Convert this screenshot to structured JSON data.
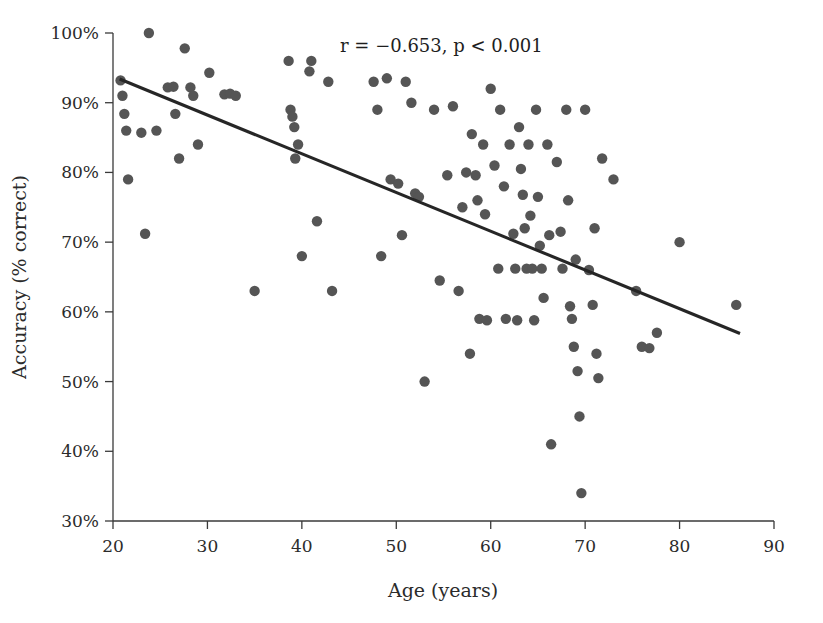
{
  "chart_data": {
    "type": "scatter",
    "title": "",
    "xlabel": "Age (years)",
    "ylabel": "Accuracy (% correct)",
    "xlim": [
      20,
      90
    ],
    "ylim": [
      30,
      100
    ],
    "xticks": [
      20,
      30,
      40,
      50,
      60,
      70,
      80,
      90
    ],
    "xtick_labels": [
      "20",
      "30",
      "40",
      "50",
      "60",
      "70",
      "80",
      "90"
    ],
    "yticks": [
      30,
      40,
      50,
      60,
      70,
      80,
      90,
      100
    ],
    "ytick_labels": [
      "30%",
      "40%",
      "50%",
      "60%",
      "70%",
      "80%",
      "90%",
      "100%"
    ],
    "grid": false,
    "legend": "none",
    "point_color": "#555555",
    "point_radius": 5.2,
    "annotation": "r = −−.653, p < 0.001",
    "annotation_text": "r = −0.653, p < 0.001",
    "annotation_x": 46.5,
    "annotation_y": 97.0,
    "correlation_r": -0.653,
    "p_value_text": "p < 0.001",
    "trend_line": {
      "color": "#262626",
      "x_start": 20.7,
      "y_start": 93.4,
      "x_end": 86.4,
      "y_end": 56.9
    },
    "points": [
      {
        "x": 20.8,
        "y": 93.2
      },
      {
        "x": 21.0,
        "y": 91.0
      },
      {
        "x": 21.2,
        "y": 88.4
      },
      {
        "x": 21.4,
        "y": 86.0
      },
      {
        "x": 21.6,
        "y": 79.0
      },
      {
        "x": 23.0,
        "y": 85.7
      },
      {
        "x": 23.4,
        "y": 71.2
      },
      {
        "x": 23.8,
        "y": 100.0
      },
      {
        "x": 24.6,
        "y": 86.0
      },
      {
        "x": 25.8,
        "y": 92.2
      },
      {
        "x": 26.4,
        "y": 92.3
      },
      {
        "x": 26.6,
        "y": 88.4
      },
      {
        "x": 27.0,
        "y": 82.0
      },
      {
        "x": 27.6,
        "y": 97.8
      },
      {
        "x": 28.2,
        "y": 92.2
      },
      {
        "x": 28.5,
        "y": 91.0
      },
      {
        "x": 29.0,
        "y": 84.0
      },
      {
        "x": 30.2,
        "y": 94.3
      },
      {
        "x": 31.8,
        "y": 91.2
      },
      {
        "x": 32.4,
        "y": 91.3
      },
      {
        "x": 33.0,
        "y": 91.0
      },
      {
        "x": 35.0,
        "y": 63.0
      },
      {
        "x": 38.6,
        "y": 96.0
      },
      {
        "x": 38.8,
        "y": 89.0
      },
      {
        "x": 39.0,
        "y": 88.0
      },
      {
        "x": 39.2,
        "y": 86.5
      },
      {
        "x": 39.3,
        "y": 82.0
      },
      {
        "x": 39.6,
        "y": 84.0
      },
      {
        "x": 40.0,
        "y": 68.0
      },
      {
        "x": 40.8,
        "y": 94.5
      },
      {
        "x": 41.0,
        "y": 96.0
      },
      {
        "x": 41.6,
        "y": 73.0
      },
      {
        "x": 42.8,
        "y": 93.0
      },
      {
        "x": 43.2,
        "y": 63.0
      },
      {
        "x": 47.6,
        "y": 93.0
      },
      {
        "x": 48.0,
        "y": 89.0
      },
      {
        "x": 48.4,
        "y": 68.0
      },
      {
        "x": 49.0,
        "y": 93.5
      },
      {
        "x": 49.4,
        "y": 79.0
      },
      {
        "x": 50.2,
        "y": 78.4
      },
      {
        "x": 50.6,
        "y": 71.0
      },
      {
        "x": 51.0,
        "y": 93.0
      },
      {
        "x": 51.6,
        "y": 90.0
      },
      {
        "x": 52.0,
        "y": 77.0
      },
      {
        "x": 52.4,
        "y": 76.5
      },
      {
        "x": 53.0,
        "y": 50.0
      },
      {
        "x": 54.0,
        "y": 89.0
      },
      {
        "x": 54.6,
        "y": 64.5
      },
      {
        "x": 55.4,
        "y": 79.6
      },
      {
        "x": 56.0,
        "y": 89.5
      },
      {
        "x": 56.6,
        "y": 63.0
      },
      {
        "x": 57.0,
        "y": 75.0
      },
      {
        "x": 57.4,
        "y": 80.0
      },
      {
        "x": 57.8,
        "y": 54.0
      },
      {
        "x": 58.0,
        "y": 85.5
      },
      {
        "x": 58.4,
        "y": 79.6
      },
      {
        "x": 58.6,
        "y": 76.0
      },
      {
        "x": 58.8,
        "y": 59.0
      },
      {
        "x": 59.2,
        "y": 84.0
      },
      {
        "x": 59.4,
        "y": 74.0
      },
      {
        "x": 59.6,
        "y": 58.8
      },
      {
        "x": 60.0,
        "y": 92.0
      },
      {
        "x": 60.4,
        "y": 81.0
      },
      {
        "x": 60.8,
        "y": 66.2
      },
      {
        "x": 61.0,
        "y": 89.0
      },
      {
        "x": 61.4,
        "y": 78.0
      },
      {
        "x": 61.6,
        "y": 59.0
      },
      {
        "x": 62.0,
        "y": 84.0
      },
      {
        "x": 62.4,
        "y": 71.2
      },
      {
        "x": 62.6,
        "y": 66.2
      },
      {
        "x": 62.8,
        "y": 58.8
      },
      {
        "x": 63.0,
        "y": 86.5
      },
      {
        "x": 63.2,
        "y": 80.5
      },
      {
        "x": 63.4,
        "y": 76.8
      },
      {
        "x": 63.6,
        "y": 72.0
      },
      {
        "x": 63.8,
        "y": 66.2
      },
      {
        "x": 64.0,
        "y": 84.0
      },
      {
        "x": 64.2,
        "y": 73.8
      },
      {
        "x": 64.4,
        "y": 66.2
      },
      {
        "x": 64.6,
        "y": 58.8
      },
      {
        "x": 64.8,
        "y": 89.0
      },
      {
        "x": 65.0,
        "y": 76.5
      },
      {
        "x": 65.2,
        "y": 69.5
      },
      {
        "x": 65.4,
        "y": 66.2
      },
      {
        "x": 65.6,
        "y": 62.0
      },
      {
        "x": 66.0,
        "y": 84.0
      },
      {
        "x": 66.2,
        "y": 71.0
      },
      {
        "x": 66.4,
        "y": 41.0
      },
      {
        "x": 67.0,
        "y": 81.5
      },
      {
        "x": 67.4,
        "y": 71.5
      },
      {
        "x": 67.6,
        "y": 66.2
      },
      {
        "x": 68.0,
        "y": 89.0
      },
      {
        "x": 68.2,
        "y": 76.0
      },
      {
        "x": 68.4,
        "y": 60.8
      },
      {
        "x": 68.6,
        "y": 59.0
      },
      {
        "x": 68.8,
        "y": 55.0
      },
      {
        "x": 69.0,
        "y": 67.5
      },
      {
        "x": 69.2,
        "y": 51.5
      },
      {
        "x": 69.4,
        "y": 45.0
      },
      {
        "x": 69.6,
        "y": 34.0
      },
      {
        "x": 70.0,
        "y": 89.0
      },
      {
        "x": 70.4,
        "y": 66.0
      },
      {
        "x": 70.8,
        "y": 61.0
      },
      {
        "x": 71.0,
        "y": 72.0
      },
      {
        "x": 71.2,
        "y": 54.0
      },
      {
        "x": 71.4,
        "y": 50.5
      },
      {
        "x": 71.8,
        "y": 82.0
      },
      {
        "x": 73.0,
        "y": 79.0
      },
      {
        "x": 75.4,
        "y": 63.0
      },
      {
        "x": 76.0,
        "y": 55.0
      },
      {
        "x": 76.8,
        "y": 54.8
      },
      {
        "x": 77.6,
        "y": 57.0
      },
      {
        "x": 80.0,
        "y": 70.0
      },
      {
        "x": 86.0,
        "y": 61.0
      }
    ]
  },
  "axes": {
    "x_axis_name": "age-axis",
    "y_axis_name": "accuracy-axis"
  }
}
